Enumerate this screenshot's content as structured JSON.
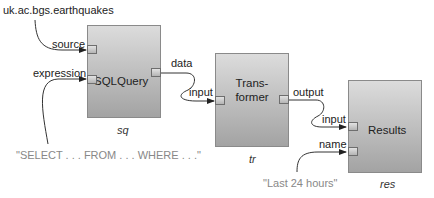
{
  "diagram": {
    "source_literal": "uk.ac.bgs.earthquakes",
    "expression_literal": "\"SELECT . . . FROM . . . WHERE . . .\"",
    "name_literal": "\"Last 24 hours\"",
    "colors": {
      "box_top": "#dcdcdc",
      "box_bottom": "#a3a3a3",
      "box_border": "#8a8a8a",
      "wire": "#333333",
      "literal_text": "#888888"
    },
    "components": [
      {
        "id": "sq",
        "type_label": "SQLQuery",
        "instance_name": "sq",
        "inputs": [
          "source",
          "expression"
        ],
        "outputs": [
          "data"
        ]
      },
      {
        "id": "tr",
        "type_label_line1": "Trans-",
        "type_label_line2": "former",
        "instance_name": "tr",
        "inputs": [
          "input"
        ],
        "outputs": [
          "output"
        ]
      },
      {
        "id": "res",
        "type_label": "Results",
        "instance_name": "res",
        "inputs": [
          "input",
          "name"
        ],
        "outputs": []
      }
    ],
    "connections": [
      {
        "from": "uk.ac.bgs.earthquakes",
        "to": "sq.source"
      },
      {
        "from": "\"SELECT . . . FROM . . . WHERE . . .\"",
        "to": "sq.expression"
      },
      {
        "from": "sq.data",
        "to": "tr.input"
      },
      {
        "from": "tr.output",
        "to": "res.input"
      },
      {
        "from": "\"Last 24 hours\"",
        "to": "res.name"
      }
    ]
  }
}
